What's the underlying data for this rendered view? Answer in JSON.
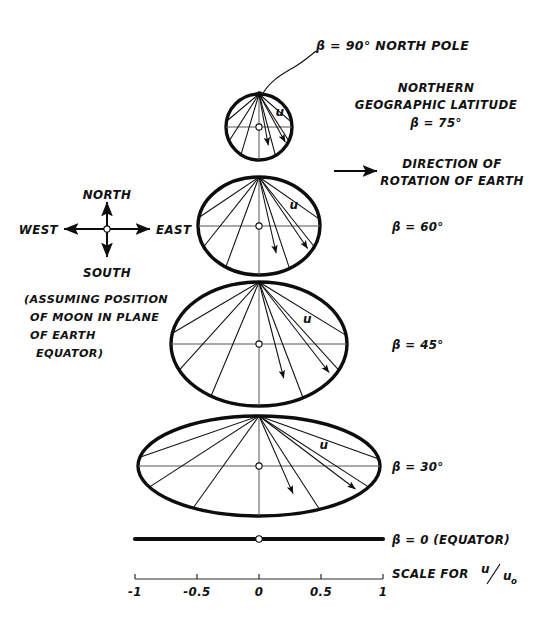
{
  "figure": {
    "title_note": "Geographic latitude diagram of lunar-induced velocity u",
    "center_x": 259,
    "unit_px": 124,
    "pole_label": "β = 90° NORTH POLE",
    "northern_line1": "NORTHERN",
    "northern_line2": "GEOGRAPHIC LATITUDE",
    "northern_line3": "β = 75°",
    "rotation_line1": "DIRECTION OF",
    "rotation_line2": "ROTATION OF EARTH",
    "equator_label": "β = 0 (EQUATOR)",
    "scale_label": "SCALE FOR",
    "scale_ratio_num": "u",
    "scale_ratio_den": "u",
    "scale_ratio_sub": "o",
    "velocity_symbol": "u"
  },
  "compass": {
    "north": "NORTH",
    "south": "SOUTH",
    "east": "EAST",
    "west": "WEST",
    "cx": 107,
    "cy": 229
  },
  "assumption": {
    "line1": "(ASSUMING POSITION",
    "line2": "OF MOON IN PLANE",
    "line3": "OF EARTH",
    "line4": "EQUATOR)"
  },
  "latitudes": [
    {
      "id": "beta75",
      "label": "β = 75°",
      "beta_deg": 75,
      "cy": 127,
      "rx": 33,
      "ry": 33,
      "label_x": 0,
      "label_y": 0,
      "label_shown": false
    },
    {
      "id": "beta60",
      "label": "β = 60°",
      "beta_deg": 60,
      "cy": 226,
      "rx": 61,
      "ry": 49,
      "label_x": 392,
      "label_y": 231,
      "label_shown": true
    },
    {
      "id": "beta45",
      "label": "β = 45°",
      "beta_deg": 45,
      "cy": 344,
      "rx": 88,
      "ry": 62,
      "label_x": 392,
      "label_y": 349,
      "label_shown": true
    },
    {
      "id": "beta30",
      "label": "β = 30°",
      "beta_deg": 30,
      "cy": 466,
      "rx": 121,
      "ry": 50,
      "label_x": 392,
      "label_y": 471,
      "label_shown": true
    }
  ],
  "equator": {
    "y": 539,
    "x1": 135,
    "x2": 383
  },
  "scale": {
    "y": 579,
    "x1": 135,
    "x2": 383,
    "ticks": [
      {
        "value": -1,
        "text": "-1",
        "x": 135
      },
      {
        "value": -0.5,
        "text": "-0.5",
        "x": 197
      },
      {
        "value": 0,
        "text": "0",
        "x": 259
      },
      {
        "value": 0.5,
        "text": "0.5",
        "x": 321
      },
      {
        "value": 1,
        "text": "1",
        "x": 383
      }
    ]
  },
  "chart_data": {
    "type": "diagram",
    "xlabel": "u/u_o",
    "xlim": [
      -1,
      1
    ],
    "xticks": [
      -1,
      -0.5,
      0,
      0.5,
      1
    ],
    "series": [
      {
        "name": "β = 90° (north pole)",
        "beta_deg": 90,
        "relative_half_width": 0.0
      },
      {
        "name": "β = 75°",
        "beta_deg": 75,
        "relative_half_width": 0.27
      },
      {
        "name": "β = 60°",
        "beta_deg": 60,
        "relative_half_width": 0.5
      },
      {
        "name": "β = 45°",
        "beta_deg": 45,
        "relative_half_width": 0.71
      },
      {
        "name": "β = 30°",
        "beta_deg": 30,
        "relative_half_width": 0.98
      },
      {
        "name": "β = 0° (equator)",
        "beta_deg": 0,
        "relative_half_width": 1.0
      }
    ]
  }
}
